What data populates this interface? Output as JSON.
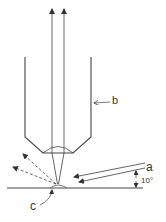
{
  "labels": {
    "a": "a",
    "b": "b",
    "c": "c",
    "angle": "10°"
  },
  "colors": {
    "stroke": "#555555",
    "text": "#333333",
    "background": "#ffffff"
  },
  "figure": {
    "elements": [
      "objective-tube",
      "reflected-beams-up",
      "incident-beams-a",
      "scattered-dashed-beams",
      "sample-surface",
      "spot-c",
      "angle-indicator-10-degrees"
    ]
  }
}
